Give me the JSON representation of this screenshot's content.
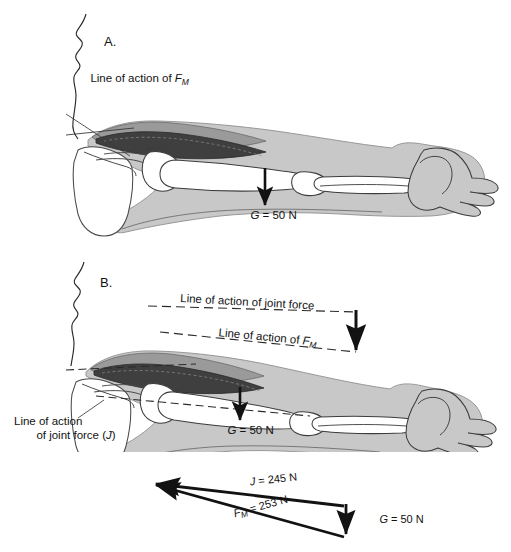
{
  "figure": {
    "background_color": "#ffffff",
    "ink_color": "#121212",
    "soft_tissue_color": "#c8c8c8",
    "deep_muscle_color": "#4a4a4a",
    "mid_muscle_color": "#8c8c8c",
    "bone_color": "#ffffff"
  },
  "panels": [
    {
      "id": "A",
      "label": "A.",
      "annotations": [
        {
          "name": "line-of-action-fm",
          "text": "Line of action of ",
          "sym": "F",
          "sub": "M"
        },
        {
          "name": "weight-label",
          "sym": "G",
          "text": " = 50 N"
        }
      ]
    },
    {
      "id": "B",
      "label": "B.",
      "annotations": [
        {
          "name": "line-of-action-joint-force",
          "text": "Line of action of joint force"
        },
        {
          "name": "line-of-action-fm",
          "text": "Line of action of ",
          "sym": "F",
          "sub": "M"
        },
        {
          "name": "line-of-action-joint-force-j-1",
          "text": "Line of action"
        },
        {
          "name": "line-of-action-joint-force-j-2",
          "text": "of joint force (",
          "sym": "J",
          "tail": ")"
        },
        {
          "name": "weight-label",
          "sym": "G",
          "text": " = 50 N"
        }
      ]
    }
  ],
  "force_triangle": {
    "name": "force-triangle",
    "vectors": [
      {
        "name": "joint-force-vector",
        "sym": "J",
        "text": " = 245 N",
        "value": 245,
        "unit": "N",
        "label": "J = 245 N"
      },
      {
        "name": "muscle-force-vector",
        "sym": "F",
        "sub": "M",
        "text": " = 253 N",
        "value": 253,
        "unit": "N",
        "label": "FM = 253 N"
      },
      {
        "name": "weight-vector",
        "sym": "G",
        "text": " = 50 N",
        "value": 50,
        "unit": "N",
        "label": "G = 50 N"
      }
    ]
  }
}
